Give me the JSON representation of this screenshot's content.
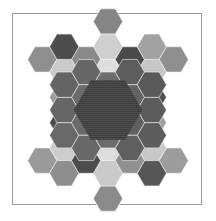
{
  "figure": {
    "background_color": "#ffffff",
    "frame": {
      "stroke_color": "#9a9a9a",
      "stroke_width": 1,
      "x": 12,
      "y": 13,
      "width": 190,
      "height": 192
    },
    "hex_geometry": {
      "orientation": "flat-top",
      "center_x": 108,
      "center_y": 110,
      "radius": 14.6,
      "step_x": 21.9,
      "step_y": 12.65,
      "tile_stroke_color": "#f2f2f2",
      "tile_stroke_width": 0.6
    },
    "palette": {
      "core_dark": "#3c3c3c",
      "core_stripe": "#4e4e4e",
      "very_dark": "#4a4a4a",
      "dark": "#565656",
      "mid_dark": "#6a6a6a",
      "mid": "#858585",
      "mid_light": "#9e9e9e",
      "light": "#c4c4c4",
      "very_light": "#dcdcdc",
      "pale": "#e8e8e8"
    },
    "core": {
      "shape": "hexagon",
      "radius": 34,
      "fill": "#3c3c3c",
      "texture": "horizontal-stripes",
      "stripe_color": "#4e4e4e",
      "stripe_spacing": 2
    },
    "tiles": [
      {
        "name": "top-tip",
        "q": 0,
        "r": -7,
        "fill": "#858585"
      },
      {
        "name": "top-stem-upper",
        "q": 0,
        "r": -5,
        "fill": "#cfcfcf"
      },
      {
        "name": "top-branch-left",
        "q": -1,
        "r": -4,
        "fill": "#8a8a8a"
      },
      {
        "name": "top-branch-center",
        "q": 0,
        "r": -3,
        "fill": "#dedede"
      },
      {
        "name": "top-branch-right",
        "q": 1,
        "r": -4,
        "fill": "#4a4a4a"
      },
      {
        "name": "top-stem-lower",
        "q": 0,
        "r": -1,
        "fill": "#d6d6d6"
      },
      {
        "name": "ul-tip",
        "q": -3,
        "r": -4,
        "fill": "#8f8f8f"
      },
      {
        "name": "ul-stem-outer",
        "q": -2,
        "r": -3,
        "fill": "#cacaca"
      },
      {
        "name": "ul-branch-up",
        "q": -2,
        "r": -5,
        "fill": "#4d4d4d"
      },
      {
        "name": "ul-branch-center",
        "q": -1,
        "r": -2,
        "fill": "#e2e2e2"
      },
      {
        "name": "ul-branch-down",
        "q": -2,
        "r": -1,
        "fill": "#9a9a9a"
      },
      {
        "name": "ur-tip",
        "q": 3,
        "r": -4,
        "fill": "#8f8f8f"
      },
      {
        "name": "ur-stem-outer",
        "q": 2,
        "r": -3,
        "fill": "#c6c6c6"
      },
      {
        "name": "ur-branch-up",
        "q": 2,
        "r": -5,
        "fill": "#a2a2a2"
      },
      {
        "name": "ur-branch-center",
        "q": 1,
        "r": -2,
        "fill": "#dcdcdc"
      },
      {
        "name": "ur-branch-down",
        "q": 2,
        "r": -1,
        "fill": "#4f4f4f"
      },
      {
        "name": "ll-tip",
        "q": -3,
        "r": 4,
        "fill": "#9a9a9a"
      },
      {
        "name": "ll-stem-outer",
        "q": -2,
        "r": 3,
        "fill": "#cdcdcd"
      },
      {
        "name": "ll-branch-up",
        "q": -2,
        "r": 1,
        "fill": "#4b4b4b"
      },
      {
        "name": "ll-branch-center",
        "q": -1,
        "r": 2,
        "fill": "#e0e0e0"
      },
      {
        "name": "ll-branch-down",
        "q": -2,
        "r": 5,
        "fill": "#8d8d8d"
      },
      {
        "name": "lr-tip",
        "q": 3,
        "r": 4,
        "fill": "#9c9c9c"
      },
      {
        "name": "lr-stem-outer",
        "q": 2,
        "r": 3,
        "fill": "#c8c8c8"
      },
      {
        "name": "lr-branch-up",
        "q": 2,
        "r": 1,
        "fill": "#a0a0a0"
      },
      {
        "name": "lr-branch-center",
        "q": 1,
        "r": 2,
        "fill": "#dedede"
      },
      {
        "name": "lr-branch-down",
        "q": 2,
        "r": 5,
        "fill": "#565656"
      },
      {
        "name": "bottom-tip",
        "q": 0,
        "r": 7,
        "fill": "#8b8b8b"
      },
      {
        "name": "bottom-stem-lower",
        "q": 0,
        "r": 5,
        "fill": "#c9c9c9"
      },
      {
        "name": "bottom-branch-left",
        "q": -1,
        "r": 4,
        "fill": "#4c4c4c"
      },
      {
        "name": "bottom-branch-center",
        "q": 0,
        "r": 3,
        "fill": "#dddddd"
      },
      {
        "name": "bottom-branch-right",
        "q": 1,
        "r": 4,
        "fill": "#909090"
      },
      {
        "name": "bottom-stem-upper",
        "q": 0,
        "r": 1,
        "fill": "#d4d4d4"
      },
      {
        "name": "ring-n",
        "q": 0,
        "r": -2,
        "fill": "#6d6d6d"
      },
      {
        "name": "ring-nne",
        "q": 1,
        "r": -3,
        "fill": "#5e5e5e"
      },
      {
        "name": "ring-nnw",
        "q": -1,
        "r": -3,
        "fill": "#676767"
      },
      {
        "name": "ring-ne",
        "q": 1,
        "r": -1,
        "fill": "#636363"
      },
      {
        "name": "ring-nw",
        "q": -1,
        "r": -1,
        "fill": "#6b6b6b"
      },
      {
        "name": "ring-e",
        "q": 2,
        "r": 0,
        "fill": "#5c5c5c"
      },
      {
        "name": "ring-w",
        "q": -2,
        "r": 0,
        "fill": "#666666"
      },
      {
        "name": "ring-ene",
        "q": 2,
        "r": -2,
        "fill": "#5a5a5a"
      },
      {
        "name": "ring-wnw",
        "q": -2,
        "r": -2,
        "fill": "#646464"
      },
      {
        "name": "ring-ese",
        "q": 2,
        "r": 2,
        "fill": "#5d5d5d"
      },
      {
        "name": "ring-wsw",
        "q": -2,
        "r": 2,
        "fill": "#696969"
      },
      {
        "name": "ring-se",
        "q": 1,
        "r": 1,
        "fill": "#606060"
      },
      {
        "name": "ring-sw",
        "q": -1,
        "r": 1,
        "fill": "#6a6a6a"
      },
      {
        "name": "ring-sse",
        "q": 1,
        "r": 3,
        "fill": "#5f5f5f"
      },
      {
        "name": "ring-ssw",
        "q": -1,
        "r": 3,
        "fill": "#686868"
      },
      {
        "name": "ring-s",
        "q": 0,
        "r": 2,
        "fill": "#6c6c6c"
      }
    ]
  }
}
